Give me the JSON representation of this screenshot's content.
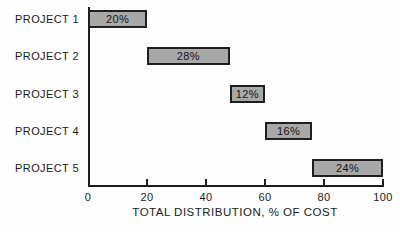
{
  "chart_data": {
    "type": "bar",
    "orientation": "horizontal",
    "variant": "cascade",
    "title": "",
    "xlabel": "TOTAL DISTRIBUTION, % OF COST",
    "categories": [
      "PROJECT 1",
      "PROJECT 2",
      "PROJECT 3",
      "PROJECT 4",
      "PROJECT 5"
    ],
    "starts": [
      0,
      20,
      48,
      60,
      76
    ],
    "values": [
      20,
      28,
      12,
      16,
      24
    ],
    "bar_labels": [
      "20%",
      "28%",
      "12%",
      "16%",
      "24%"
    ],
    "x_ticks": [
      0,
      20,
      40,
      60,
      80,
      100
    ],
    "xlim": [
      0,
      100
    ],
    "grid": false,
    "legend": "none",
    "colors": {
      "bar_fill": "#a8a8a8",
      "bar_border": "#1e1e1e",
      "axis": "#1e1e1e",
      "text": "#1b1b1b",
      "background": "#fefefe"
    }
  }
}
